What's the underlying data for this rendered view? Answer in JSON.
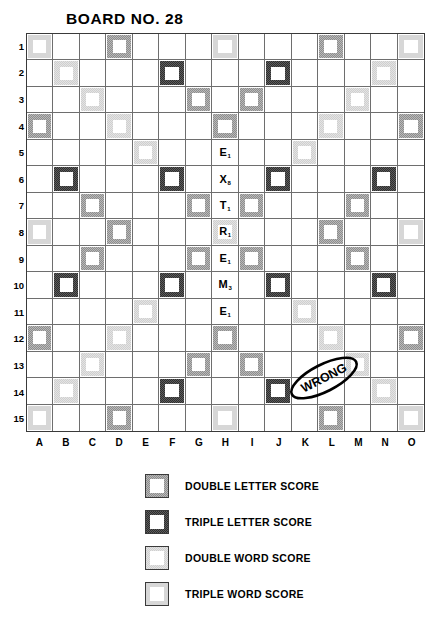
{
  "board": {
    "title": "BOARD NO. 28",
    "size": 15,
    "column_labels": [
      "A",
      "B",
      "C",
      "D",
      "E",
      "F",
      "G",
      "H",
      "I",
      "J",
      "K",
      "L",
      "M",
      "N",
      "O"
    ],
    "row_labels": [
      "1",
      "2",
      "3",
      "4",
      "5",
      "6",
      "7",
      "8",
      "9",
      "10",
      "11",
      "12",
      "13",
      "14",
      "15"
    ],
    "premium_squares": {
      "triple-word": [
        "A1",
        "H1",
        "O1",
        "A8",
        "O8",
        "A15",
        "H15",
        "O15"
      ],
      "double-word": [
        "B2",
        "N2",
        "C3",
        "M3",
        "D4",
        "L4",
        "E5",
        "K5",
        "E11",
        "K11",
        "D12",
        "L12",
        "C13",
        "M13",
        "B14",
        "N14"
      ],
      "triple-letter": [
        "F2",
        "J2",
        "B6",
        "F6",
        "J6",
        "N6",
        "B10",
        "F10",
        "J10",
        "N10",
        "F14",
        "J14"
      ],
      "double-letter": [
        "D1",
        "L1",
        "G3",
        "I3",
        "A4",
        "H4",
        "O4",
        "C7",
        "G7",
        "I7",
        "M7",
        "D8",
        "L8",
        "C9",
        "G9",
        "I9",
        "M9",
        "H12",
        "A12",
        "D12x",
        "G13",
        "I13"
      ],
      "center": "H8"
    },
    "tiles": [
      {
        "square": "H5",
        "letter": "E",
        "value": "1"
      },
      {
        "square": "H6",
        "letter": "X",
        "value": "8"
      },
      {
        "square": "H7",
        "letter": "T",
        "value": "1"
      },
      {
        "square": "H8",
        "letter": "R",
        "value": "1"
      },
      {
        "square": "H9",
        "letter": "E",
        "value": "1"
      },
      {
        "square": "H10",
        "letter": "M",
        "value": "3"
      },
      {
        "square": "H11",
        "letter": "E",
        "value": "1"
      }
    ],
    "word_on_board": "EXTREME",
    "annotation": {
      "text": "WRONG",
      "shape": "ellipse",
      "near_squares": "J12-K12"
    }
  },
  "legend": {
    "items": [
      {
        "key": "double-letter",
        "label": "DOUBLE LETTER SCORE"
      },
      {
        "key": "triple-letter",
        "label": "TRIPLE LETTER SCORE"
      },
      {
        "key": "double-word",
        "label": "DOUBLE WORD SCORE"
      },
      {
        "key": "triple-word",
        "label": "TRIPLE WORD SCORE"
      }
    ]
  },
  "colors": {
    "ink": "#000000",
    "grid_line": "#6e6e6e",
    "border": "#3a3a3a",
    "double_letter": "#b9b9b9",
    "triple_letter": "#5d5d5d",
    "double_word": "#e4e4e4",
    "triple_word": "#d7d7d7"
  }
}
